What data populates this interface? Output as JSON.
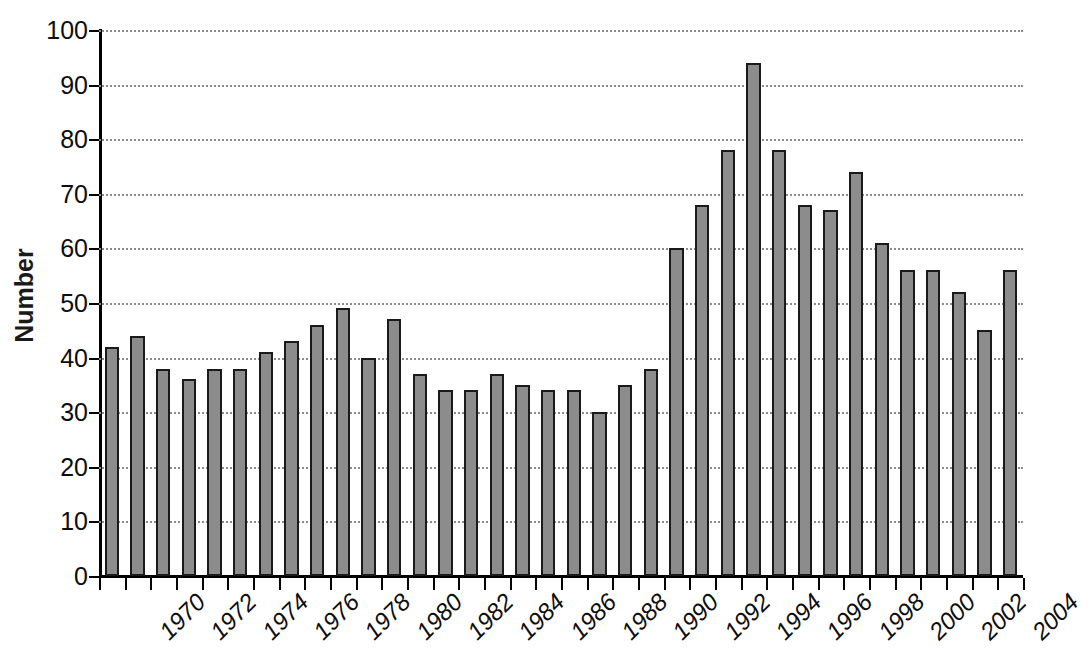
{
  "chart_data": {
    "type": "bar",
    "title": "",
    "xlabel": "",
    "ylabel": "Number",
    "ylim": [
      0,
      100
    ],
    "ytick_step": 10,
    "yticks": [
      0,
      10,
      20,
      30,
      40,
      50,
      60,
      70,
      80,
      90,
      100
    ],
    "ytick_labels": [
      "0",
      "10",
      "20",
      "30",
      "40",
      "50",
      "60",
      "70",
      "80",
      "90",
      "100"
    ],
    "grid": "horizontal-dotted",
    "legend": "none",
    "xtick_labels": [
      "1970",
      "1972",
      "1974",
      "1976",
      "1978",
      "1980",
      "1982",
      "1984",
      "1986",
      "1988",
      "1990",
      "1992",
      "1994",
      "1996",
      "1998",
      "2000",
      "2002",
      "2004"
    ],
    "xtick_label_rotation": -45,
    "xtick_label_style": "italic",
    "categories": [
      "1970",
      "1971",
      "1972",
      "1973",
      "1974",
      "1975",
      "1976",
      "1977",
      "1978",
      "1979",
      "1980",
      "1981",
      "1982",
      "1983",
      "1984",
      "1985",
      "1986",
      "1987",
      "1988",
      "1989",
      "1990",
      "1991",
      "1992",
      "1993",
      "1994",
      "1995",
      "1996",
      "1997",
      "1998",
      "1999",
      "2000",
      "2001",
      "2002",
      "2003",
      "2004",
      "2005"
    ],
    "values": [
      42,
      44,
      38,
      36,
      38,
      38,
      41,
      43,
      46,
      49,
      40,
      47,
      37,
      34,
      34,
      37,
      35,
      34,
      34,
      30,
      35,
      38,
      60,
      68,
      78,
      94,
      78,
      68,
      67,
      74,
      61,
      56,
      56,
      52,
      45,
      56
    ],
    "bar_fill_color": "#8c8c8c",
    "bar_border_color": "#1a1a1a",
    "background_color": "#ffffff",
    "grid_color": "#8a8a8a",
    "axis_color": "#000000"
  }
}
